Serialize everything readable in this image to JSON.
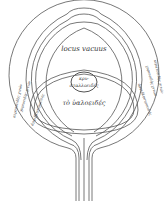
{
  "diagram": {
    "labels": {
      "top_space": "locus vacuus",
      "lens_line1": "κρυ-",
      "lens_line2": "σταλλοειδές",
      "vitreous": "τὸ ὑαλοειδές",
      "left_outer": "κερατοειδὴς χιτών",
      "left_mid": "χοριοειδὴς χιτών",
      "left_inner": "ἀμφιβληστροειδής",
      "right_outer": "κερατοειδὴς χιτών",
      "right_mid": "χοριοειδὴς χιτών",
      "right_inner": "ἀμφιβληστροειδής"
    },
    "colors": {
      "line": "#555555",
      "text": "#333333",
      "background": "#ffffff"
    }
  }
}
